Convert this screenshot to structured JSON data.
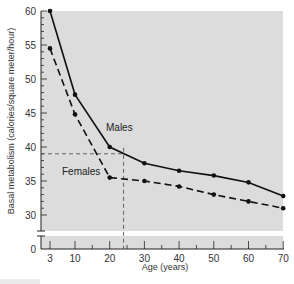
{
  "chart_data": {
    "type": "line",
    "title": "",
    "xlabel": "Age (years)",
    "ylabel": "Basal metabolism (calories/square meter/hour)",
    "x": [
      3,
      10,
      20,
      30,
      40,
      50,
      60,
      70
    ],
    "x_tick_labels": [
      "3",
      "10",
      "20",
      "30",
      "40",
      "50",
      "60",
      "70"
    ],
    "y_tick_labels": [
      "60",
      "55",
      "50",
      "45",
      "40",
      "35",
      "30",
      "0"
    ],
    "ylim": [
      30,
      60
    ],
    "y_axis_break": true,
    "grid": false,
    "series": [
      {
        "name": "Males",
        "style": "solid",
        "values": [
          60,
          47.7,
          40,
          37.6,
          36.5,
          35.8,
          34.8,
          32.8
        ]
      },
      {
        "name": "Females",
        "style": "dashed",
        "values": [
          54.5,
          44.8,
          35.5,
          35,
          34.2,
          33,
          32,
          31
        ]
      }
    ],
    "annotations": [
      {
        "type": "reference-lines",
        "x": 24,
        "y": 39,
        "style": "dashed"
      }
    ]
  },
  "labels": {
    "males": "Males",
    "females": "Females",
    "xlabel": "Age (years)",
    "ylabel": "Basal metabolism (calories/square meter/hour)",
    "y_zero": "0"
  },
  "colors": {
    "plot_background": "#dcdcdc",
    "line": "#111111",
    "text": "#333333"
  }
}
